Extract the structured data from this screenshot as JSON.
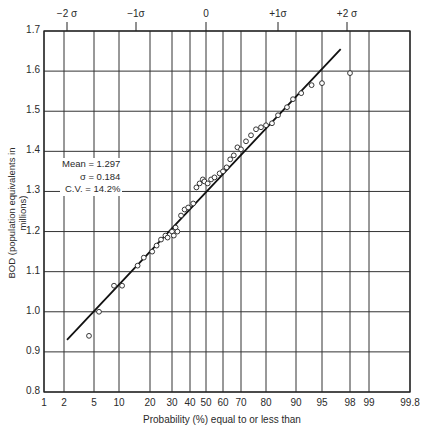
{
  "chart_data": {
    "type": "scatter",
    "subtype": "normal-probability-plot",
    "title": "",
    "xlabel": "Probability (%) equal to or less than",
    "ylabel": "BOD (population equivalents in millions)",
    "ylim": [
      0.8,
      1.7
    ],
    "yticks": [
      "0.8",
      "0.9",
      "1.0",
      "1.1",
      "1.2",
      "1.3",
      "1.4",
      "1.5",
      "1.6",
      "1.7"
    ],
    "xticks": [
      "1",
      "2",
      "5",
      "10",
      "20",
      "30",
      "40",
      "50",
      "60",
      "70",
      "80",
      "90",
      "95",
      "98",
      "99",
      "99.8"
    ],
    "top_axis_ticks": [
      "−2 σ",
      "−1σ",
      "0",
      "+1σ",
      "+2 σ"
    ],
    "grid": true,
    "annotation": {
      "mean": "Mean = 1.297",
      "sigma": "σ = 0.184",
      "cv": "C.V. = 14.2%"
    },
    "fit_line": {
      "x": [
        2.3,
        97
      ],
      "y": [
        0.93,
        1.655
      ]
    },
    "points": {
      "x": [
        4.5,
        6,
        9,
        11,
        16,
        18,
        21,
        23,
        25,
        27,
        28,
        30,
        31,
        32,
        33,
        35,
        37,
        39,
        42,
        44,
        46,
        48,
        49,
        51,
        53,
        55,
        58,
        60,
        62,
        64,
        66,
        68,
        70,
        72,
        74,
        76,
        78,
        80,
        82,
        84,
        87,
        89,
        91,
        93,
        95,
        98
      ],
      "y": [
        0.94,
        1.0,
        1.065,
        1.065,
        1.115,
        1.135,
        1.15,
        1.165,
        1.18,
        1.19,
        1.185,
        1.2,
        1.19,
        1.21,
        1.2,
        1.24,
        1.255,
        1.26,
        1.27,
        1.31,
        1.32,
        1.33,
        1.325,
        1.32,
        1.33,
        1.335,
        1.345,
        1.35,
        1.36,
        1.38,
        1.39,
        1.41,
        1.405,
        1.425,
        1.44,
        1.455,
        1.46,
        1.465,
        1.47,
        1.49,
        1.51,
        1.53,
        1.545,
        1.565,
        1.57,
        1.595
      ]
    }
  },
  "labels": {
    "y_axis": "BOD (population equivalents in millions)",
    "x_axis": "Probability (%) equal to or less than",
    "mean": "Mean = 1.297",
    "sigma": "σ = 0.184",
    "cv": "C.V. = 14.2%"
  }
}
